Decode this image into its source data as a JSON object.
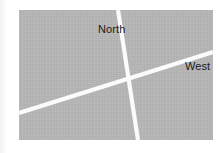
{
  "figure": {
    "kind": "scanned-map-figure",
    "canvas": {
      "width": 221,
      "height": 153,
      "background": "#ffffff"
    },
    "panel": {
      "name": "map-panel",
      "x": 19,
      "y": 10,
      "width": 194,
      "height": 130,
      "fill_color": "#b6b6b6"
    },
    "page_edge": {
      "visible": true,
      "color": "#f2f2f2"
    }
  },
  "roads": {
    "color": "#fbfbfb",
    "width_px": 4.2,
    "items": [
      {
        "id": "road-north-south",
        "label_ref": "North",
        "orientation": "near-vertical",
        "start": {
          "x": 99,
          "y": 0
        },
        "end": {
          "x": 119,
          "y": 130
        }
      },
      {
        "id": "road-east-west",
        "label_ref": "West",
        "orientation": "diagonal-rising",
        "start": {
          "x": 0,
          "y": 103
        },
        "end": {
          "x": 194,
          "y": 42
        }
      }
    ]
  },
  "labels": {
    "north": {
      "text": "North",
      "x": 79,
      "y": 13,
      "color": "#1b1b1b",
      "font_size": 11
    },
    "west": {
      "text": "West",
      "x": 166,
      "y": 50,
      "color": "#1b1b1b",
      "font_size": 11
    }
  }
}
